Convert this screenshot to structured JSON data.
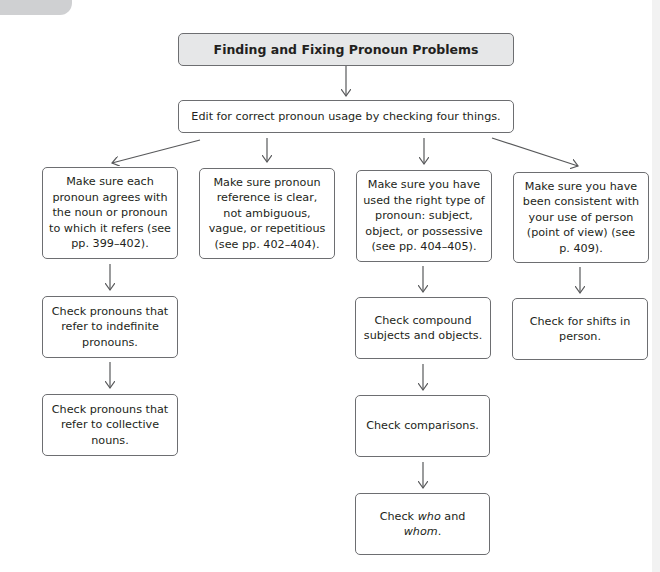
{
  "diagram": {
    "title": "Finding and Fixing Pronoun Problems",
    "root": "Edit for correct pronoun usage by checking four things.",
    "branches": [
      {
        "text": "Make sure each pronoun agrees with the noun or pronoun to which it refers (see pp. 399–402).",
        "children": [
          "Check pronouns that refer to indefinite pronouns.",
          "Check pronouns that refer to collective nouns."
        ]
      },
      {
        "text": "Make sure pronoun reference is clear, not ambiguous, vague, or repetitious (see pp. 402–404).",
        "children": []
      },
      {
        "text": "Make sure you have used the right type of pronoun: subject, object, or possessive (see pp. 404–405).",
        "children": [
          "Check compound subjects and objects.",
          "Check comparisons.",
          {
            "prefix": "Check ",
            "italic1": "who",
            "middle": " and ",
            "italic2": "whom",
            "suffix": "."
          }
        ]
      },
      {
        "text": "Make sure you have been consistent with your use of person (point of view) (see p. 409).",
        "children": [
          "Check for shifts in person."
        ]
      }
    ]
  },
  "colors": {
    "title_fill": "#e6e7e8",
    "border": "#6d6e71",
    "arrow": "#58595b",
    "text": "#231f20"
  }
}
